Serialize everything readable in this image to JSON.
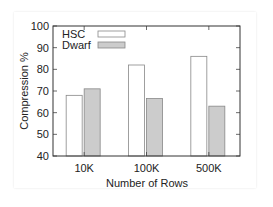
{
  "chart_data": {
    "type": "bar",
    "title": "",
    "xlabel": "Number of Rows",
    "ylabel": "Compression %",
    "categories": [
      "10K",
      "100K",
      "500K"
    ],
    "series": [
      {
        "name": "HSC",
        "values": [
          68,
          82,
          86
        ],
        "color": "#ffffff"
      },
      {
        "name": "Dwarf",
        "values": [
          71,
          66.5,
          63
        ],
        "color": "#cccccc"
      }
    ],
    "ylim": [
      40,
      100
    ],
    "yticks": [
      40,
      50,
      60,
      70,
      80,
      90,
      100
    ],
    "grid": false,
    "legend_position": "top-left"
  }
}
